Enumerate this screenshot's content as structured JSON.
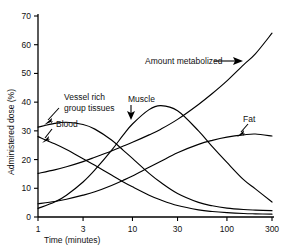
{
  "chart_data": {
    "type": "line",
    "title": "",
    "xlabel": "Time (minutes)",
    "ylabel": "Administered dose (%)",
    "xscale": "log",
    "yscale": "linear",
    "xlim": [
      1,
      300
    ],
    "ylim": [
      0,
      70
    ],
    "xticks": [
      1,
      3,
      10,
      30,
      100,
      300
    ],
    "xtick_labels": [
      "1",
      "3",
      "10",
      "30",
      "100",
      "300"
    ],
    "yticks": [
      0,
      10,
      20,
      30,
      40,
      50,
      60,
      70
    ],
    "ytick_labels": [
      "0",
      "10",
      "20",
      "30",
      "40",
      "50",
      "60",
      "70"
    ],
    "grid": false,
    "legend": "none (inline annotated labels with arrows)",
    "x": [
      1,
      1.5,
      2,
      3,
      4,
      6,
      8,
      10,
      15,
      20,
      30,
      50,
      70,
      100,
      150,
      200,
      300
    ],
    "series": [
      {
        "name": "Blood",
        "values": [
          28,
          25.5,
          23.5,
          20.3,
          18,
          14.6,
          12.2,
          10.5,
          7.6,
          5.9,
          4.0,
          2.5,
          1.9,
          1.5,
          1.2,
          1.1,
          1.0
        ]
      },
      {
        "name": "Vessel rich group tissues",
        "values": [
          31.3,
          32.6,
          33.0,
          32.2,
          30.6,
          26.8,
          23.2,
          20.4,
          15.2,
          12.0,
          8.2,
          5.1,
          3.9,
          3.1,
          2.6,
          2.4,
          2.2
        ]
      },
      {
        "name": "Muscle",
        "values": [
          3.0,
          5.2,
          7.6,
          12.2,
          16.4,
          23.2,
          28.6,
          32.4,
          37.4,
          38.8,
          37.0,
          30.0,
          24.5,
          19.0,
          13.0,
          9.8,
          5.2
        ]
      },
      {
        "name": "Fat",
        "values": [
          4.6,
          5.4,
          6.2,
          7.6,
          8.8,
          11.0,
          12.8,
          14.3,
          17.3,
          19.4,
          22.4,
          25.3,
          26.7,
          27.8,
          28.6,
          28.9,
          28.2
        ]
      },
      {
        "name": "Amount metabolized",
        "values": [
          15.2,
          16.4,
          17.5,
          19.3,
          20.8,
          23.0,
          24.7,
          26.0,
          28.6,
          30.6,
          34.0,
          39.2,
          43.0,
          47.4,
          53.0,
          56.8,
          64.0
        ]
      }
    ],
    "annotations": [
      {
        "id": "vessel-rich",
        "text_lines": [
          "Vessel rich",
          "group tissues"
        ],
        "points_to_series": "Vessel rich group tissues"
      },
      {
        "id": "blood",
        "text_lines": [
          "Blood"
        ],
        "points_to_series": "Blood"
      },
      {
        "id": "muscle",
        "text_lines": [
          "Muscle"
        ],
        "points_to_series": "Muscle"
      },
      {
        "id": "fat",
        "text_lines": [
          "Fat"
        ],
        "points_to_series": "Fat"
      },
      {
        "id": "amount-metabolized",
        "text_lines": [
          "Amount metabolized"
        ],
        "points_to_series": "Amount metabolized"
      }
    ]
  },
  "labels": {
    "xaxis_title": "Time (minutes)",
    "yaxis_title": "Administered dose (%)",
    "vessel_rich_line1": "Vessel rich",
    "vessel_rich_line2": "group tissues",
    "blood": "Blood",
    "muscle": "Muscle",
    "fat": "Fat",
    "amount_metabolized": "Amount metabolized"
  },
  "colors": {
    "curve": "#000000",
    "axis": "#000000",
    "background": "#ffffff",
    "text": "#111111"
  }
}
